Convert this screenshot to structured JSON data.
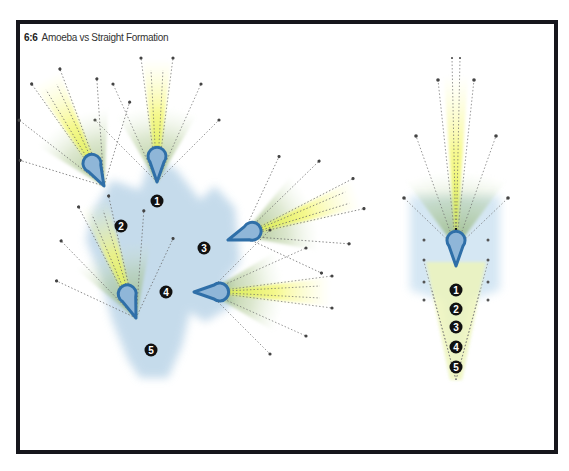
{
  "figure": {
    "number": "6:6",
    "title": "Amoeba vs Straight Formation"
  },
  "colors": {
    "frame": "#16161c",
    "blob": "#b9d3e6",
    "cone_green": "#8cae6a",
    "cone_yellow": "#f2f55a",
    "teardrop": "#2f6fa8",
    "badge": "#111111",
    "badge_text": "#ffffff",
    "ray": "#555555"
  },
  "formations": [
    {
      "name": "amoeba",
      "members": [
        {
          "label": "1",
          "x": 157,
          "y": 200,
          "heading": -90
        },
        {
          "label": "2",
          "x": 120,
          "y": 226,
          "heading": -120
        },
        {
          "label": "3",
          "x": 204,
          "y": 247,
          "heading": -20
        },
        {
          "label": "4",
          "x": 166,
          "y": 292,
          "heading": 0
        },
        {
          "label": "5",
          "x": 150,
          "y": 349,
          "heading": -110
        }
      ]
    },
    {
      "name": "straight",
      "members": [
        {
          "label": "1",
          "x": 456,
          "y": 289,
          "heading": -90
        },
        {
          "label": "2",
          "x": 456,
          "y": 309
        },
        {
          "label": "3",
          "x": 456,
          "y": 327
        },
        {
          "label": "4",
          "x": 456,
          "y": 347
        },
        {
          "label": "5",
          "x": 456,
          "y": 367
        }
      ]
    }
  ]
}
